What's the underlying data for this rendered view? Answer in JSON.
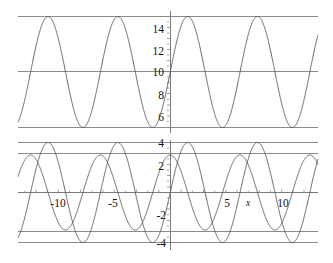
{
  "chart_data": [
    {
      "id": "upper-plot",
      "type": "line",
      "title": "",
      "xlabel": "",
      "ylabel": "",
      "xlim": [
        -13.7,
        13.3
      ],
      "ylim": [
        4.55,
        15.45
      ],
      "grid": true,
      "gridlines_y": [
        5,
        10,
        15
      ],
      "xticks": [],
      "xtick_labels": [],
      "yticks": [
        6,
        8,
        10,
        12,
        14
      ],
      "ytick_labels": [
        "6",
        "8",
        "10",
        "12",
        "14"
      ],
      "minor_ticks": true,
      "legend": "none",
      "series": [
        {
          "name": "5 sin(x) + 10",
          "amplitude": 5,
          "offset": 10,
          "period": 6.2832,
          "phase": 0.0,
          "color": "#555555"
        }
      ]
    },
    {
      "id": "lower-plot",
      "type": "line",
      "title": "",
      "xlabel": "x",
      "ylabel": "",
      "xlim": [
        -13.7,
        13.3
      ],
      "ylim": [
        -4.45,
        4.45
      ],
      "grid": true,
      "gridlines_y": [
        4,
        3,
        0,
        -3,
        -4
      ],
      "xticks": [
        -10,
        -5,
        5,
        10
      ],
      "xtick_labels": [
        "-10",
        "-5",
        "5",
        "10"
      ],
      "yticks": [
        4,
        2,
        -2,
        -4
      ],
      "ytick_labels": [
        "4",
        "2",
        "-2",
        "-4"
      ],
      "minor_ticks": true,
      "legend": "none",
      "series": [
        {
          "name": "4 sin(x)",
          "amplitude": 4,
          "offset": 0,
          "period": 6.2832,
          "phase": 0.0,
          "color": "#555555"
        },
        {
          "name": "3 cos(x)",
          "amplitude": 3,
          "offset": 0,
          "period": 6.2832,
          "phase": 1.5708,
          "color": "#555555"
        }
      ]
    }
  ],
  "figure": {
    "background_color": "#ffffff",
    "curve_color": "#555555",
    "grid_color": "#8a8a8a",
    "axis_color": "#7a7a7a",
    "text_color": "#111111",
    "x_axis_label": "x"
  }
}
